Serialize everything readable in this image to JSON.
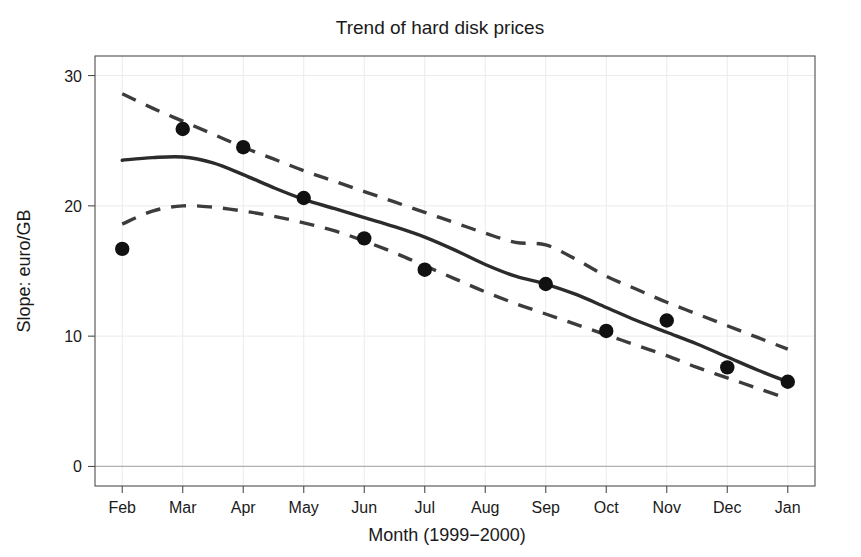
{
  "chart_data": {
    "type": "scatter",
    "title": "Trend of hard disk prices",
    "xlabel": "Month (1999−2000)",
    "ylabel": "Slope: euro/GB",
    "categories": [
      "Feb",
      "Mar",
      "Apr",
      "May",
      "Jun",
      "Jul",
      "Aug",
      "Sep",
      "Oct",
      "Nov",
      "Dec",
      "Jan"
    ],
    "x": [
      1,
      2,
      3,
      4,
      5,
      6,
      7,
      8,
      9,
      10,
      11,
      12
    ],
    "values": [
      16.7,
      25.9,
      24.5,
      20.6,
      17.5,
      15.1,
      null,
      14.0,
      10.4,
      11.2,
      7.6,
      6.5
    ],
    "ylim": [
      -1.5,
      31.5
    ],
    "yticks": [
      0,
      10,
      20,
      30
    ],
    "ytick_labels": [
      "0",
      "10",
      "20",
      "30"
    ],
    "xlim": [
      0.55,
      12.45
    ],
    "grid": true,
    "grid_color": "#ebebeb",
    "legend": "none",
    "series": [
      {
        "name": "observed",
        "type": "scatter",
        "marker": "filled-circle",
        "color": "#111111",
        "categories": [
          "Feb",
          "Mar",
          "Apr",
          "May",
          "Jun",
          "Jul",
          "Sep",
          "Oct",
          "Nov",
          "Dec",
          "Jan"
        ],
        "x": [
          1,
          2,
          3,
          4,
          5,
          6,
          8,
          9,
          10,
          11,
          12
        ],
        "values": [
          16.7,
          25.9,
          24.5,
          20.6,
          17.5,
          15.1,
          14.0,
          10.4,
          11.2,
          7.6,
          6.5
        ]
      },
      {
        "name": "smoothed fit",
        "type": "line",
        "style": "solid",
        "color": "#2b2b2b",
        "x": [
          1,
          1.5,
          2,
          2.5,
          3,
          3.5,
          4,
          4.5,
          5,
          5.5,
          6,
          6.5,
          7,
          7.5,
          8,
          8.5,
          9,
          9.5,
          10,
          10.5,
          11,
          11.5,
          12
        ],
        "values": [
          23.5,
          23.7,
          23.75,
          23.3,
          22.4,
          21.4,
          20.5,
          19.8,
          19.1,
          18.4,
          17.6,
          16.6,
          15.5,
          14.6,
          14.0,
          13.2,
          12.2,
          11.2,
          10.3,
          9.4,
          8.4,
          7.4,
          6.5
        ]
      },
      {
        "name": "upper confidence bound",
        "type": "line",
        "style": "dashed",
        "color": "#3c3c3c",
        "x": [
          1,
          1.5,
          2,
          2.5,
          3,
          3.5,
          4,
          4.5,
          5,
          5.5,
          6,
          6.5,
          7,
          7.5,
          8,
          8.5,
          9,
          9.5,
          10,
          10.5,
          11,
          11.5,
          12
        ],
        "values": [
          28.6,
          27.5,
          26.5,
          25.5,
          24.5,
          23.6,
          22.7,
          21.9,
          21.1,
          20.3,
          19.5,
          18.7,
          17.9,
          17.2,
          17.0,
          15.9,
          14.6,
          13.6,
          12.6,
          11.7,
          10.8,
          9.9,
          9.0
        ]
      },
      {
        "name": "lower confidence bound",
        "type": "line",
        "style": "dashed",
        "color": "#3c3c3c",
        "x": [
          1,
          1.5,
          2,
          2.5,
          3,
          3.5,
          4,
          4.5,
          5,
          5.5,
          6,
          6.5,
          7,
          7.5,
          8,
          8.5,
          9,
          9.5,
          10,
          10.5,
          11,
          11.5,
          12
        ],
        "values": [
          18.6,
          19.6,
          20.0,
          19.9,
          19.6,
          19.2,
          18.7,
          18.1,
          17.3,
          16.4,
          15.4,
          14.4,
          13.4,
          12.5,
          11.7,
          10.9,
          10.1,
          9.3,
          8.5,
          7.6,
          6.8,
          6.0,
          5.2
        ]
      }
    ]
  }
}
